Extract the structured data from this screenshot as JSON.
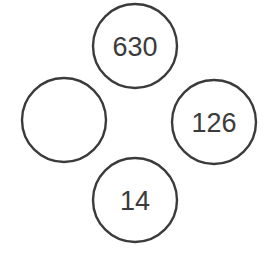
{
  "diagram": {
    "type": "circle-chain-number-puzzle",
    "background_color": "#ffffff",
    "stroke_color": "#3b3b3b",
    "stroke_width": 2.4,
    "text_color": "#3b3b3b",
    "radius": 42,
    "nodes": [
      {
        "id": "top",
        "position": "top",
        "label": "630",
        "cx": 135,
        "cy": 46,
        "r": 42,
        "empty": false
      },
      {
        "id": "right",
        "position": "right",
        "label": "126",
        "cx": 214,
        "cy": 122,
        "r": 42,
        "empty": false
      },
      {
        "id": "bottom",
        "position": "bottom",
        "label": "14",
        "cx": 135,
        "cy": 200,
        "r": 42,
        "empty": false
      },
      {
        "id": "left",
        "position": "left",
        "label": "",
        "cx": 64,
        "cy": 120,
        "r": 42,
        "empty": true
      }
    ]
  }
}
